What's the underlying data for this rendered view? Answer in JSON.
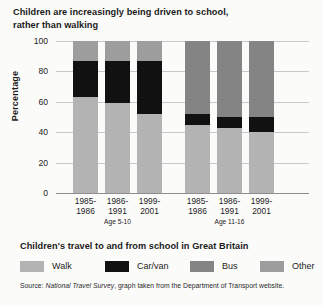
{
  "title": {
    "line1": "Children are increasingly being driven to school,",
    "line2": "rather than walking"
  },
  "legend": {
    "heading": "Children's travel to and from school in Great Britain",
    "items": [
      {
        "label": "Walk",
        "color": "#b3b3b3"
      },
      {
        "label": "Car/van",
        "color": "#111111"
      },
      {
        "label": "Bus",
        "color": "#848484"
      },
      {
        "label": "Other",
        "color": "#9d9d9d"
      }
    ]
  },
  "source": {
    "prefix": "Source: ",
    "italic": "National Travel Survey",
    "suffix": ", graph taken from the Department of Transport website."
  },
  "chart_data": {
    "type": "bar",
    "subtype": "stacked-bar",
    "title": "Children are increasingly being driven to school, rather than walking",
    "xlabel": "",
    "ylabel": "Percentage",
    "ylim": [
      0,
      100
    ],
    "yticks": [
      0,
      20,
      40,
      60,
      80,
      100
    ],
    "ytick_labels": [
      "0",
      "20",
      "40",
      "60",
      "80",
      "100"
    ],
    "grid": true,
    "legend_position": "bottom",
    "categories": [
      "1985-\n1986",
      "1986-\n1991",
      "1999-\n2001",
      "1985-\n1986",
      "1986-\n1991",
      "1999-\n2001"
    ],
    "groups": [
      {
        "name": "Age 5-10",
        "categories": [
          {
            "line1": "1985-",
            "line2": "1986"
          },
          {
            "line1": "1986-",
            "line2": "1991"
          },
          {
            "line1": "1999-",
            "line2": "2001"
          }
        ]
      },
      {
        "name": "Age 11-16",
        "categories": [
          {
            "line1": "1985-",
            "line2": "1986"
          },
          {
            "line1": "1986-",
            "line2": "1991"
          },
          {
            "line1": "1999-",
            "line2": "2001"
          }
        ]
      }
    ],
    "series": [
      {
        "name": "Walk",
        "color": "#b3b3b3",
        "values": [
          63,
          59,
          52,
          45,
          43,
          40
        ]
      },
      {
        "name": "Car/van",
        "color": "#111111",
        "values": [
          24,
          28,
          35,
          7,
          7,
          10
        ]
      },
      {
        "name": "Bus",
        "color": "#848484",
        "values": [
          0,
          0,
          0,
          48,
          50,
          50
        ]
      },
      {
        "name": "Other",
        "color": "#9d9d9d",
        "values": [
          13,
          13,
          13,
          0,
          0,
          0
        ]
      }
    ],
    "bars": [
      {
        "group": "Age 5-10",
        "category": "1985-1986",
        "segments": [
          {
            "series": "Walk",
            "value": 63,
            "from": 0,
            "to": 63
          },
          {
            "series": "Car/van",
            "value": 24,
            "from": 63,
            "to": 87
          },
          {
            "series": "Other",
            "value": 13,
            "from": 87,
            "to": 100
          }
        ]
      },
      {
        "group": "Age 5-10",
        "category": "1986-1991",
        "segments": [
          {
            "series": "Walk",
            "value": 59,
            "from": 0,
            "to": 59
          },
          {
            "series": "Car/van",
            "value": 28,
            "from": 59,
            "to": 87
          },
          {
            "series": "Other",
            "value": 13,
            "from": 87,
            "to": 100
          }
        ]
      },
      {
        "group": "Age 5-10",
        "category": "1999-2001",
        "segments": [
          {
            "series": "Walk",
            "value": 52,
            "from": 0,
            "to": 52
          },
          {
            "series": "Car/van",
            "value": 35,
            "from": 52,
            "to": 87
          },
          {
            "series": "Other",
            "value": 13,
            "from": 87,
            "to": 100
          }
        ]
      },
      {
        "group": "Age 11-16",
        "category": "1985-1986",
        "segments": [
          {
            "series": "Walk",
            "value": 45,
            "from": 0,
            "to": 45
          },
          {
            "series": "Car/van",
            "value": 7,
            "from": 45,
            "to": 52
          },
          {
            "series": "Bus",
            "value": 48,
            "from": 52,
            "to": 100
          }
        ]
      },
      {
        "group": "Age 11-16",
        "category": "1986-1991",
        "segments": [
          {
            "series": "Walk",
            "value": 43,
            "from": 0,
            "to": 43
          },
          {
            "series": "Car/van",
            "value": 7,
            "from": 43,
            "to": 50
          },
          {
            "series": "Bus",
            "value": 50,
            "from": 50,
            "to": 100
          }
        ]
      },
      {
        "group": "Age 11-16",
        "category": "1999-2001",
        "segments": [
          {
            "series": "Walk",
            "value": 40,
            "from": 0,
            "to": 40
          },
          {
            "series": "Car/van",
            "value": 10,
            "from": 40,
            "to": 50
          },
          {
            "series": "Bus",
            "value": 50,
            "from": 50,
            "to": 100
          }
        ]
      }
    ]
  }
}
